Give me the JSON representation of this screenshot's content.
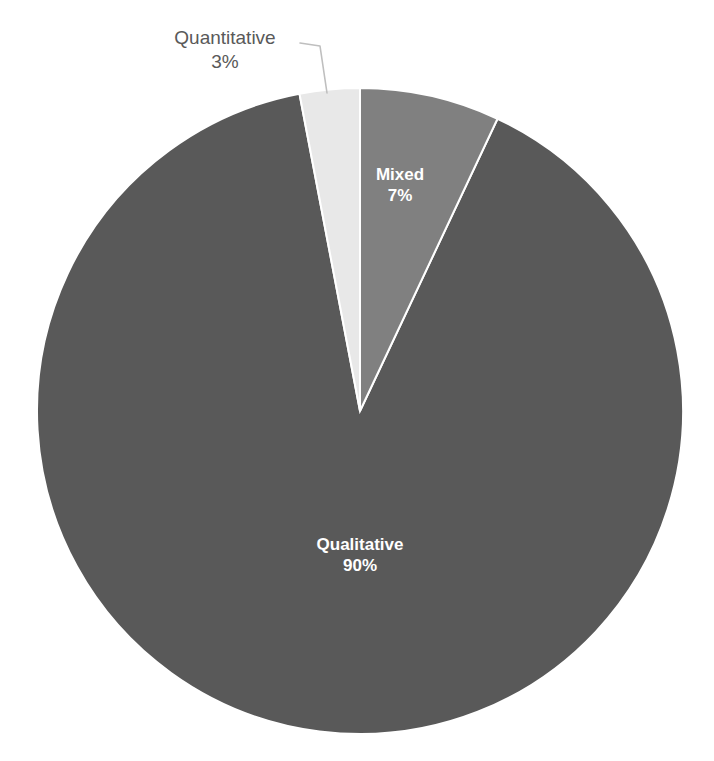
{
  "chart_data": {
    "type": "pie",
    "title": "",
    "categories": [
      "Qualitative",
      "Mixed",
      "Quantitative"
    ],
    "values": [
      90,
      7,
      3
    ],
    "unit": "%",
    "legend": "none",
    "labels_shown": "category name and percentage",
    "slices": [
      {
        "name": "Qualitative",
        "value": 90,
        "value_label": "90%",
        "color": "#595959",
        "label_position": "inside",
        "label_color": "#ffffff"
      },
      {
        "name": "Mixed",
        "value": 7,
        "value_label": "7%",
        "color": "#808080",
        "label_position": "inside",
        "label_color": "#ffffff"
      },
      {
        "name": "Quantitative",
        "value": 3,
        "value_label": "3%",
        "color": "#e8e8e8",
        "label_position": "outside-callout",
        "label_color": "#595959"
      }
    ],
    "colors": {
      "qualitative": "#595959",
      "mixed": "#808080",
      "quantitative": "#e8e8e8",
      "slice_border": "#ffffff",
      "leader_line": "#bfbfbf",
      "background": "#ffffff",
      "outside_label_text": "#595959",
      "inside_label_text": "#ffffff"
    },
    "geometry": {
      "center_x": 360,
      "center_y": 411,
      "radius": 323,
      "start_angle_deg": 0,
      "direction": "clockwise"
    }
  },
  "labels": {
    "quantitative": {
      "name": "Quantitative",
      "value": "3%"
    },
    "mixed": {
      "name": "Mixed",
      "value": "7%"
    },
    "qualitative": {
      "name": "Qualitative",
      "value": "90%"
    }
  }
}
